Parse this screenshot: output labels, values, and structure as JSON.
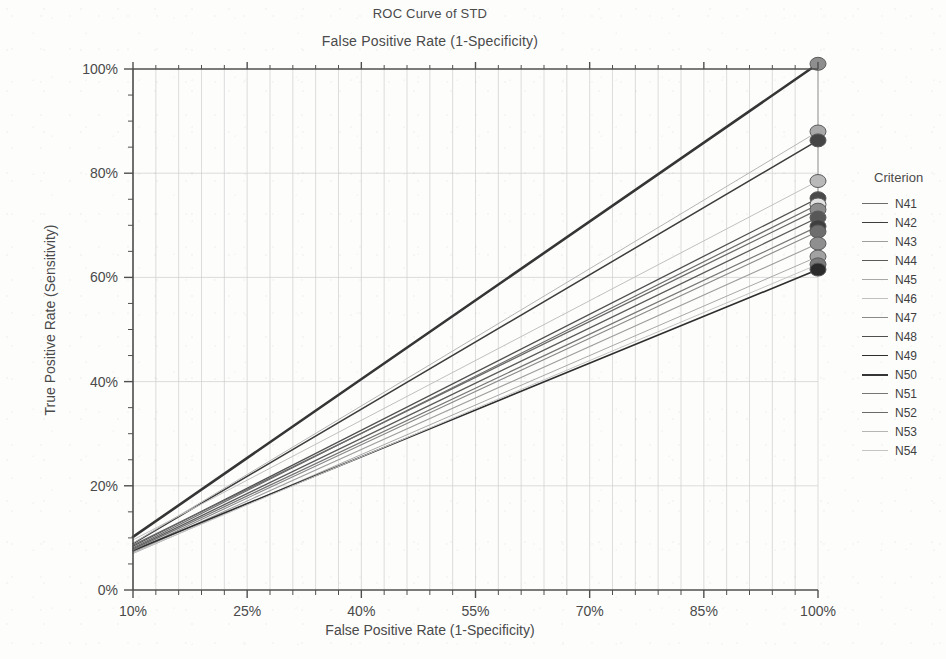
{
  "chart_data": {
    "type": "line",
    "title": "ROC Curve of STD",
    "subtitle": "False Positive Rate (1-Specificity)",
    "xlabel": "False Positive Rate (1-Specificity)",
    "ylabel": "True Positive Rate (Sensitivity)",
    "legend_title": "Criterion",
    "legend_position": "right",
    "grid": true,
    "xlim": [
      10,
      100
    ],
    "ylim": [
      0,
      100
    ],
    "x_ticks": [
      "10%",
      "25%",
      "40%",
      "55%",
      "70%",
      "85%",
      "100%"
    ],
    "x_tick_values": [
      10,
      25,
      40,
      55,
      70,
      85,
      100
    ],
    "y_ticks": [
      "0%",
      "20%",
      "40%",
      "60%",
      "80%",
      "100%"
    ],
    "y_tick_values": [
      0,
      20,
      40,
      60,
      80,
      100
    ],
    "x_minor_step": 3,
    "y_minor_step": 5,
    "marker": "circle",
    "series": [
      {
        "name": "N41",
        "color": "#6d6d6d",
        "width": 1.2,
        "x": [
          10,
          100
        ],
        "values": [
          8.1,
          74.0
        ]
      },
      {
        "name": "N42",
        "color": "#3d3d3d",
        "width": 1.5,
        "x": [
          10,
          100
        ],
        "values": [
          8.9,
          86.3
        ]
      },
      {
        "name": "N43",
        "color": "#9e9e9e",
        "width": 1.1,
        "x": [
          10,
          100
        ],
        "values": [
          7.2,
          66.5
        ]
      },
      {
        "name": "N44",
        "color": "#5a5a5a",
        "width": 1.3,
        "x": [
          10,
          100
        ],
        "values": [
          7.9,
          71.5
        ]
      },
      {
        "name": "N45",
        "color": "#a8a8a8",
        "width": 1.0,
        "x": [
          10,
          100
        ],
        "values": [
          7.0,
          64.0
        ]
      },
      {
        "name": "N46",
        "color": "#c0c0c0",
        "width": 1.0,
        "x": [
          10,
          100
        ],
        "values": [
          9.6,
          78.5
        ]
      },
      {
        "name": "N47",
        "color": "#8a8a8a",
        "width": 1.1,
        "x": [
          10,
          100
        ],
        "values": [
          7.4,
          68.8
        ]
      },
      {
        "name": "N48",
        "color": "#4f4f4f",
        "width": 1.3,
        "x": [
          10,
          100
        ],
        "values": [
          8.4,
          75.2
        ]
      },
      {
        "name": "N49",
        "color": "#2e2e2e",
        "width": 1.6,
        "x": [
          10,
          100
        ],
        "values": [
          7.6,
          61.5
        ]
      },
      {
        "name": "N50",
        "color": "#353535",
        "width": 2.6,
        "x": [
          10,
          100
        ],
        "values": [
          10.2,
          101.0
        ]
      },
      {
        "name": "N51",
        "color": "#767676",
        "width": 1.2,
        "x": [
          10,
          100
        ],
        "values": [
          7.7,
          69.8
        ]
      },
      {
        "name": "N52",
        "color": "#6a6a6a",
        "width": 1.3,
        "x": [
          10,
          100
        ],
        "values": [
          8.6,
          73.0
        ]
      },
      {
        "name": "N53",
        "color": "#b5b5b5",
        "width": 1.0,
        "x": [
          10,
          100
        ],
        "values": [
          9.0,
          88.0
        ]
      },
      {
        "name": "N54",
        "color": "#c4c4c4",
        "width": 1.0,
        "x": [
          10,
          100
        ],
        "values": [
          7.1,
          62.5
        ]
      }
    ],
    "endpoint_markers": [
      {
        "series": "N50",
        "x": 100,
        "y": 101.0,
        "fill": "#8e8e8e"
      },
      {
        "series": "N53",
        "x": 100,
        "y": 88.0,
        "fill": "#a9a9a9"
      },
      {
        "series": "N42",
        "x": 100,
        "y": 86.3,
        "fill": "#454545"
      },
      {
        "series": "N46",
        "x": 100,
        "y": 78.5,
        "fill": "#b9b9b9"
      },
      {
        "series": "N48",
        "x": 100,
        "y": 75.2,
        "fill": "#4a4a4a"
      },
      {
        "series": "N41",
        "x": 100,
        "y": 74.0,
        "fill": "#e2e2e2"
      },
      {
        "series": "N52",
        "x": 100,
        "y": 73.0,
        "fill": "#8d8d8d"
      },
      {
        "series": "N44",
        "x": 100,
        "y": 71.5,
        "fill": "#575757"
      },
      {
        "series": "N51",
        "x": 100,
        "y": 69.8,
        "fill": "#3f3f3f"
      },
      {
        "series": "N47",
        "x": 100,
        "y": 68.8,
        "fill": "#6e6e6e"
      },
      {
        "series": "N43",
        "x": 100,
        "y": 66.5,
        "fill": "#8f8f8f"
      },
      {
        "series": "N45",
        "x": 100,
        "y": 64.0,
        "fill": "#a2a2a2"
      },
      {
        "series": "N54",
        "x": 100,
        "y": 62.5,
        "fill": "#7a7a7a"
      },
      {
        "series": "N49",
        "x": 100,
        "y": 61.5,
        "fill": "#2b2b2b"
      }
    ],
    "colors": {
      "axis": "#4f4f4f",
      "grid": "#cfcfcf",
      "background": "#fdfdfc",
      "text": "#4a4a4a"
    }
  }
}
